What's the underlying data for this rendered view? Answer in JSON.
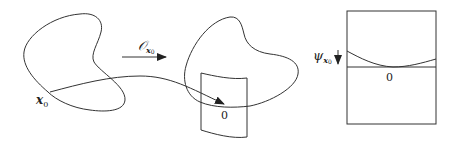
{
  "figure": {
    "left_point_label": "x",
    "left_point_subscript": "0",
    "map_label": "𝒪",
    "map_subscript": "x",
    "map_subsubscript": "0",
    "patch_origin_label": "0",
    "right_function_label": "ψ",
    "right_function_subscript": "x",
    "right_function_subsubscript": "0",
    "right_origin_label": "0"
  },
  "colors": {
    "stroke": "#333333",
    "background": "#ffffff"
  }
}
